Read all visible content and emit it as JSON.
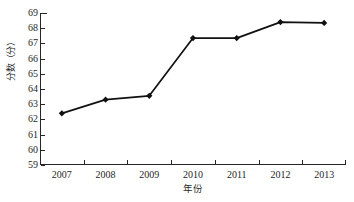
{
  "chart_data": {
    "type": "line",
    "title": "",
    "subtitle": "",
    "xlabel": "年份",
    "ylabel": "分数（分）",
    "categories": [
      "2007",
      "2008",
      "2009",
      "2010",
      "2011",
      "2012",
      "2013"
    ],
    "values": [
      62.4,
      63.3,
      63.55,
      67.35,
      67.35,
      68.4,
      68.35
    ],
    "series": [
      {
        "name": "分数",
        "values": [
          62.4,
          63.3,
          63.55,
          67.35,
          67.35,
          68.4,
          68.35
        ]
      }
    ],
    "ylim": [
      59,
      69
    ],
    "yticks": [
      59,
      60,
      61,
      62,
      63,
      64,
      65,
      66,
      67,
      68,
      69
    ],
    "ytick_labels": [
      "59",
      "60",
      "61",
      "62",
      "63",
      "64",
      "65",
      "66",
      "67",
      "68",
      "69"
    ],
    "xtick_labels": [
      "2007",
      "2008",
      "2009",
      "2010",
      "2011",
      "2012",
      "2013"
    ],
    "grid": false,
    "legend": false,
    "legend_position": "none",
    "marker": "diamond",
    "line_color": "#111111",
    "marker_color": "#111111",
    "background_color": "#ffffff",
    "axis_color": "#262626",
    "tick_direction": "in",
    "annotations": []
  }
}
